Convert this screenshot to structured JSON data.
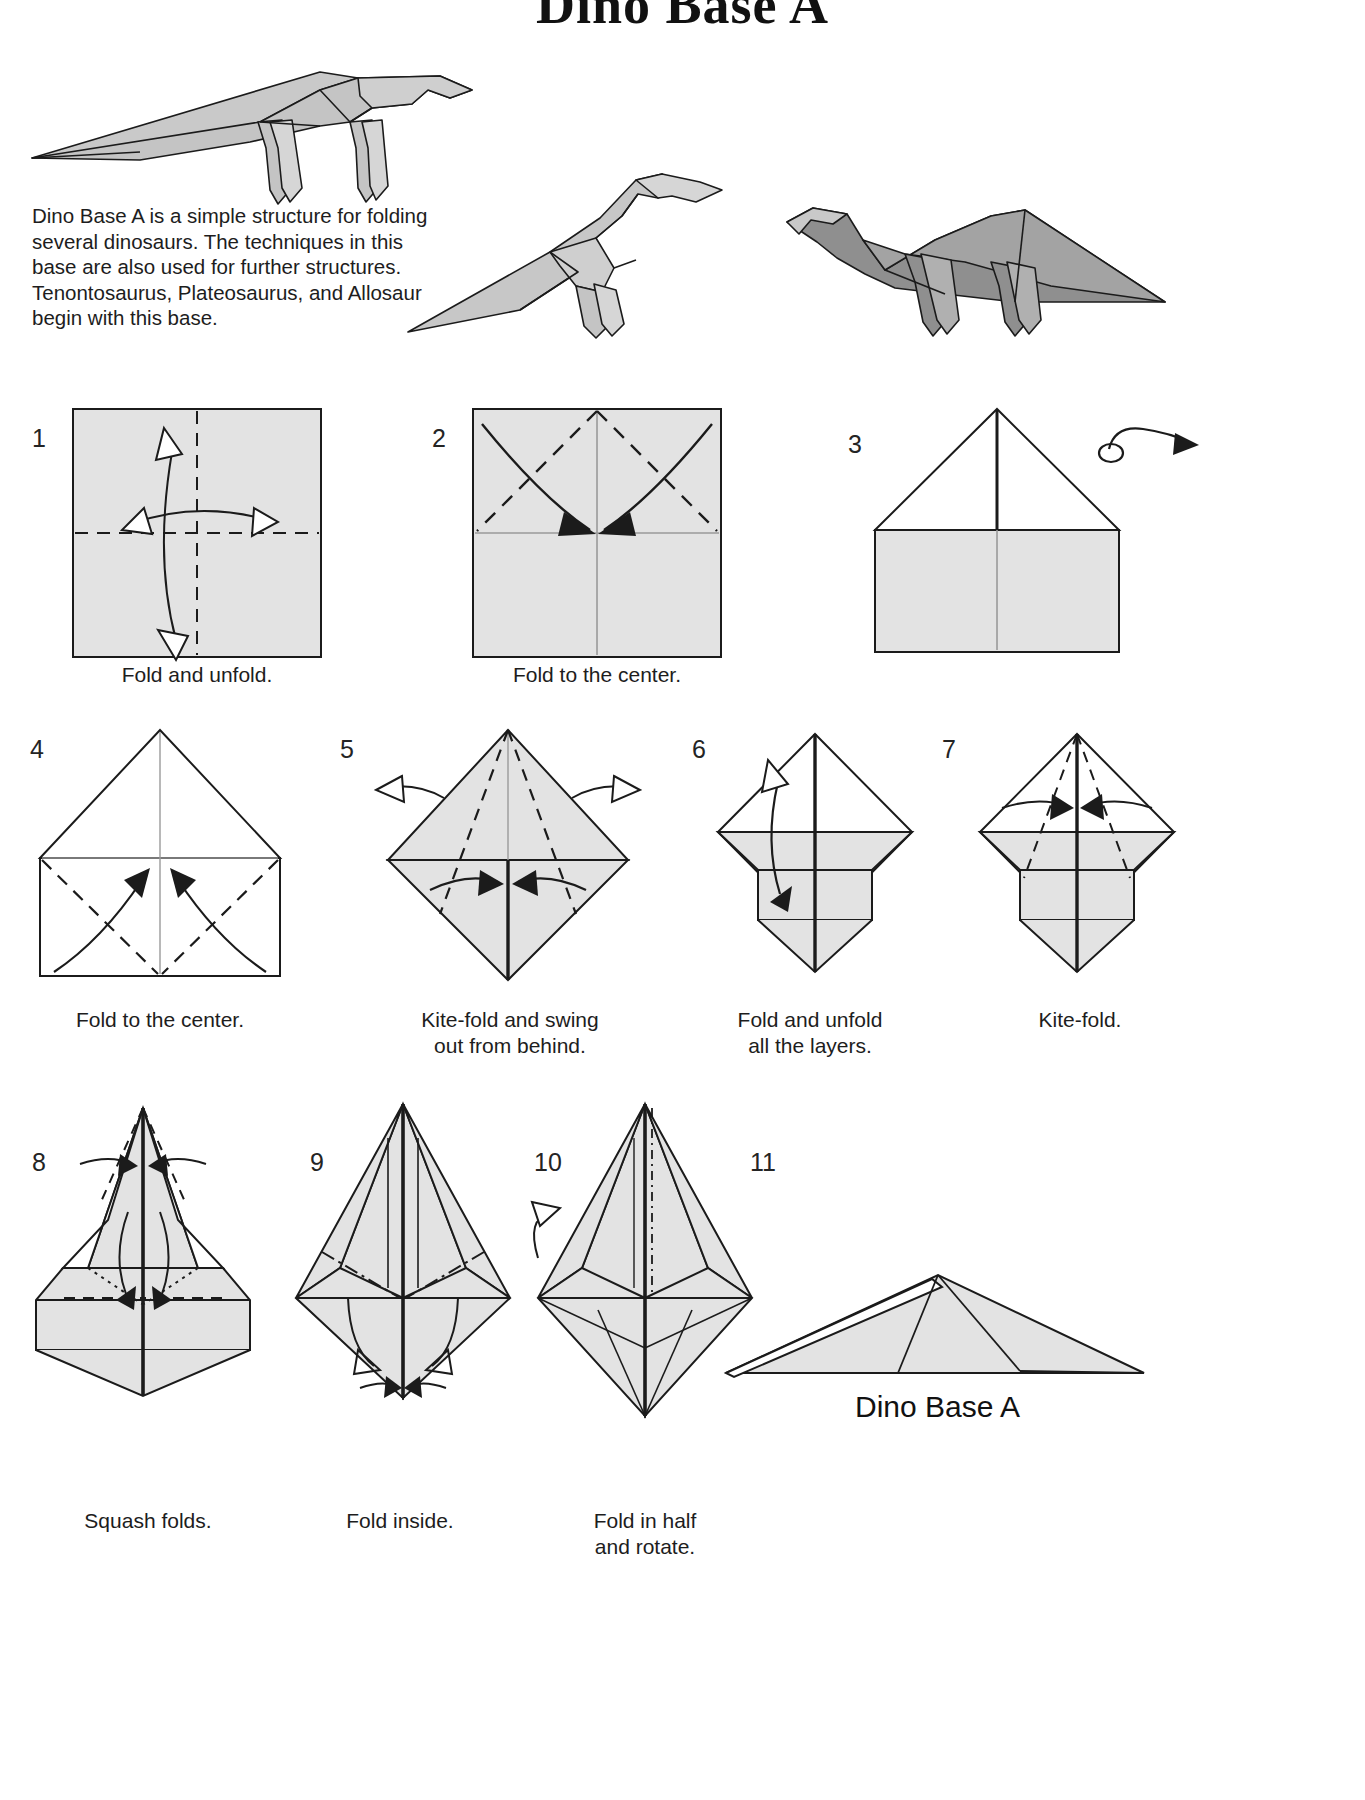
{
  "page": {
    "title": "Dino Base A",
    "intro_text": "Dino Base A is a simple structure for folding several dinosaurs. The techniques in this base are also used for further structures. Tenontosaurus, Plateosaurus, and Allosaur begin with this base.",
    "final_label": "Dino Base A",
    "paper_fill": "#e3e3e3",
    "paper_fill_dark": "#8f8f8f",
    "line_color": "#1b1b1b"
  },
  "models": [
    {
      "name": "tenontosaurus-model",
      "shade": "light"
    },
    {
      "name": "allosaur-model",
      "shade": "light"
    },
    {
      "name": "plateosaurus-model",
      "shade": "dark"
    }
  ],
  "steps": [
    {
      "number": "1",
      "caption": "Fold and unfold."
    },
    {
      "number": "2",
      "caption": "Fold to the center."
    },
    {
      "number": "3",
      "caption": ""
    },
    {
      "number": "4",
      "caption": "Fold to the center."
    },
    {
      "number": "5",
      "caption": "Kite-fold and swing\nout from behind."
    },
    {
      "number": "6",
      "caption": "Fold and unfold\nall the layers."
    },
    {
      "number": "7",
      "caption": "Kite-fold."
    },
    {
      "number": "8",
      "caption": "Squash folds."
    },
    {
      "number": "9",
      "caption": "Fold inside."
    },
    {
      "number": "10",
      "caption": "Fold in half\nand rotate."
    },
    {
      "number": "11",
      "caption": ""
    }
  ],
  "icons": {
    "turnover": "turnover-arrow-icon"
  }
}
